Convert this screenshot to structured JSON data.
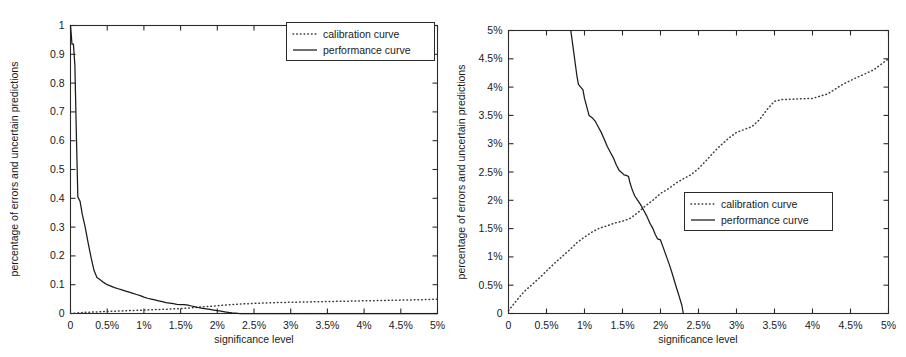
{
  "figure": {
    "background_color": "#ffffff",
    "ink_color": "#1a1a1a",
    "panel_count": 2
  },
  "chart_data": [
    {
      "type": "line",
      "panel": "left",
      "title": "",
      "xlabel": "significance level",
      "ylabel": "percentage of errors and uncertain predictions",
      "xlim": [
        0,
        5
      ],
      "ylim": [
        0,
        1
      ],
      "grid": false,
      "xtick_labels": [
        "0",
        "0.5%",
        "1%",
        "1.5%",
        "2%",
        "2.5%",
        "3%",
        "3.5%",
        "4%",
        "4.5%",
        "5%"
      ],
      "xtick_values": [
        0,
        0.5,
        1,
        1.5,
        2,
        2.5,
        3,
        3.5,
        4,
        4.5,
        5
      ],
      "ytick_labels": [
        "0",
        "0.1",
        "0.2",
        "0.3",
        "0.4",
        "0.5",
        "0.6",
        "0.7",
        "0.8",
        "0.9",
        "1"
      ],
      "ytick_values": [
        0,
        0.1,
        0.2,
        0.3,
        0.4,
        0.5,
        0.6,
        0.7,
        0.8,
        0.9,
        1
      ],
      "legend_position": "top-right",
      "series": [
        {
          "name": "calibration curve",
          "style": "dotted",
          "x": [
            0,
            0.1,
            0.2,
            0.3,
            0.4,
            0.5,
            0.6,
            0.7,
            0.8,
            0.9,
            1.0,
            1.1,
            1.2,
            1.3,
            1.4,
            1.5,
            1.6,
            1.7,
            1.8,
            1.9,
            2.0,
            2.2,
            2.4,
            2.6,
            2.8,
            3.0,
            3.2,
            3.4,
            3.6,
            3.8,
            4.0,
            4.2,
            4.4,
            4.6,
            4.8,
            5.0
          ],
          "y": [
            0.0,
            0.002,
            0.004,
            0.005,
            0.006,
            0.007,
            0.008,
            0.009,
            0.01,
            0.011,
            0.012,
            0.013,
            0.014,
            0.015,
            0.016,
            0.017,
            0.019,
            0.021,
            0.023,
            0.025,
            0.027,
            0.031,
            0.034,
            0.036,
            0.038,
            0.039,
            0.04,
            0.041,
            0.042,
            0.043,
            0.044,
            0.045,
            0.046,
            0.047,
            0.048,
            0.05
          ]
        },
        {
          "name": "performance curve",
          "style": "solid",
          "x": [
            0,
            0.01,
            0.02,
            0.04,
            0.06,
            0.08,
            0.1,
            0.13,
            0.16,
            0.2,
            0.24,
            0.28,
            0.32,
            0.36,
            0.4,
            0.45,
            0.5,
            0.55,
            0.6,
            0.65,
            0.7,
            0.75,
            0.8,
            0.85,
            0.9,
            0.95,
            1.0,
            1.05,
            1.1,
            1.15,
            1.2,
            1.25,
            1.3,
            1.35,
            1.4,
            1.45,
            1.5,
            1.55,
            1.6,
            1.65,
            1.7,
            1.75,
            1.8,
            1.85,
            1.9,
            1.95,
            2.0,
            2.05,
            2.1,
            2.15,
            2.2,
            2.25,
            2.3,
            2.5,
            3.0,
            3.5,
            4.0,
            4.5,
            5.0
          ],
          "y": [
            1.0,
            0.97,
            0.935,
            0.935,
            0.86,
            0.62,
            0.405,
            0.39,
            0.345,
            0.3,
            0.245,
            0.195,
            0.15,
            0.125,
            0.118,
            0.108,
            0.1,
            0.095,
            0.09,
            0.086,
            0.082,
            0.078,
            0.074,
            0.07,
            0.066,
            0.062,
            0.057,
            0.053,
            0.05,
            0.047,
            0.044,
            0.041,
            0.038,
            0.036,
            0.034,
            0.032,
            0.031,
            0.031,
            0.029,
            0.026,
            0.023,
            0.02,
            0.018,
            0.016,
            0.014,
            0.012,
            0.01,
            0.008,
            0.006,
            0.004,
            0.002,
            0.001,
            0.0,
            0.0,
            0.0,
            0.0,
            0.0,
            0.0,
            0.0
          ]
        }
      ]
    },
    {
      "type": "line",
      "panel": "right",
      "title": "",
      "xlabel": "significance level",
      "ylabel": "percentage of errors and uncertain predictions",
      "xlim": [
        0,
        5
      ],
      "ylim": [
        0,
        5
      ],
      "grid": false,
      "xtick_labels": [
        "0",
        "0.5%",
        "1%",
        "1.5%",
        "2%",
        "2.5%",
        "3%",
        "3.5%",
        "4%",
        "4.5%",
        "5%"
      ],
      "xtick_values": [
        0,
        0.5,
        1,
        1.5,
        2,
        2.5,
        3,
        3.5,
        4,
        4.5,
        5
      ],
      "ytick_labels": [
        "0",
        "0.5%",
        "1%",
        "1.5%",
        "2%",
        "2.5%",
        "3%",
        "3.5%",
        "4%",
        "4.5%",
        "5%"
      ],
      "ytick_values": [
        0,
        0.5,
        1,
        1.5,
        2,
        2.5,
        3,
        3.5,
        4,
        4.5,
        5
      ],
      "legend_position": "middle-right",
      "series": [
        {
          "name": "calibration curve",
          "style": "dotted",
          "x": [
            0,
            0.1,
            0.2,
            0.3,
            0.4,
            0.5,
            0.6,
            0.7,
            0.8,
            0.9,
            1.0,
            1.1,
            1.2,
            1.3,
            1.4,
            1.5,
            1.6,
            1.7,
            1.8,
            1.9,
            2.0,
            2.1,
            2.2,
            2.3,
            2.4,
            2.5,
            2.6,
            2.7,
            2.8,
            2.9,
            3.0,
            3.1,
            3.2,
            3.3,
            3.4,
            3.5,
            3.6,
            3.8,
            4.0,
            4.2,
            4.4,
            4.6,
            4.8,
            5.0
          ],
          "y": [
            0.05,
            0.22,
            0.38,
            0.5,
            0.62,
            0.75,
            0.88,
            1.0,
            1.12,
            1.25,
            1.35,
            1.44,
            1.51,
            1.55,
            1.6,
            1.63,
            1.68,
            1.78,
            1.9,
            2.0,
            2.12,
            2.2,
            2.3,
            2.38,
            2.45,
            2.56,
            2.7,
            2.85,
            2.98,
            3.1,
            3.2,
            3.25,
            3.3,
            3.42,
            3.6,
            3.75,
            3.78,
            3.79,
            3.8,
            3.88,
            4.05,
            4.18,
            4.3,
            4.5
          ]
        },
        {
          "name": "performance curve",
          "style": "solid",
          "x": [
            0.82,
            0.84,
            0.86,
            0.88,
            0.9,
            0.92,
            0.95,
            0.98,
            1.0,
            1.03,
            1.06,
            1.1,
            1.14,
            1.18,
            1.22,
            1.26,
            1.3,
            1.34,
            1.38,
            1.42,
            1.46,
            1.5,
            1.52,
            1.55,
            1.58,
            1.6,
            1.63,
            1.66,
            1.7,
            1.74,
            1.78,
            1.82,
            1.86,
            1.9,
            1.93,
            1.96,
            2.0,
            2.04,
            2.08,
            2.12,
            2.16,
            2.2,
            2.24,
            2.28,
            2.3
          ],
          "y": [
            5.0,
            4.8,
            4.6,
            4.4,
            4.2,
            4.05,
            4.0,
            3.95,
            3.8,
            3.65,
            3.5,
            3.46,
            3.4,
            3.3,
            3.2,
            3.08,
            2.95,
            2.85,
            2.75,
            2.62,
            2.52,
            2.48,
            2.45,
            2.44,
            2.42,
            2.3,
            2.18,
            2.08,
            2.0,
            1.92,
            1.82,
            1.72,
            1.6,
            1.5,
            1.4,
            1.32,
            1.3,
            1.15,
            1.0,
            0.85,
            0.68,
            0.5,
            0.33,
            0.15,
            0.0
          ]
        }
      ]
    }
  ]
}
